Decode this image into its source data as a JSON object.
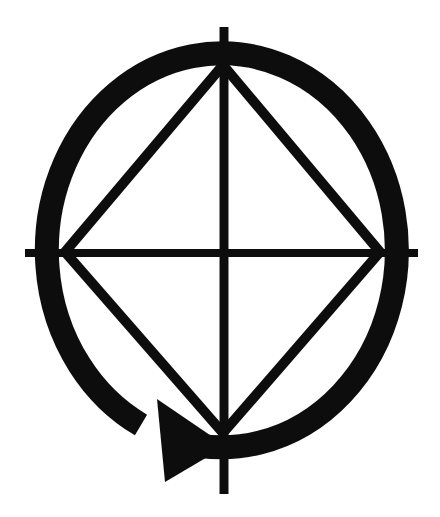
{
  "image": {
    "description": "Black geometric symbol on white: a thick elliptical rotation ring with an arrowhead near the bottom pointing right, an inscribed diamond touching the ring's inner edge, and thin vertical and horizontal axis lines extending slightly beyond the ring",
    "background_color": "#ffffff",
    "ink_color": "#111111",
    "canvas": {
      "width": 440,
      "height": 517
    },
    "ring": {
      "cx": 223,
      "cy": 252,
      "rx": 175,
      "ry": 197,
      "stroke_width": 24,
      "path": "M 141 425 A 175 197 0 1 1 178 441"
    },
    "axes": {
      "horizontal": {
        "x1": 25,
        "x2": 418,
        "y": 253,
        "stroke_width": 8
      },
      "vertical": {
        "x": 224,
        "y1": 27,
        "y2": 494,
        "stroke_width": 9
      }
    },
    "diamond": {
      "points": "223,65 380,252 223,433 65,252",
      "stroke_width": 10
    },
    "arrowhead": {
      "points": "157,399 226,446 165,482"
    }
  }
}
